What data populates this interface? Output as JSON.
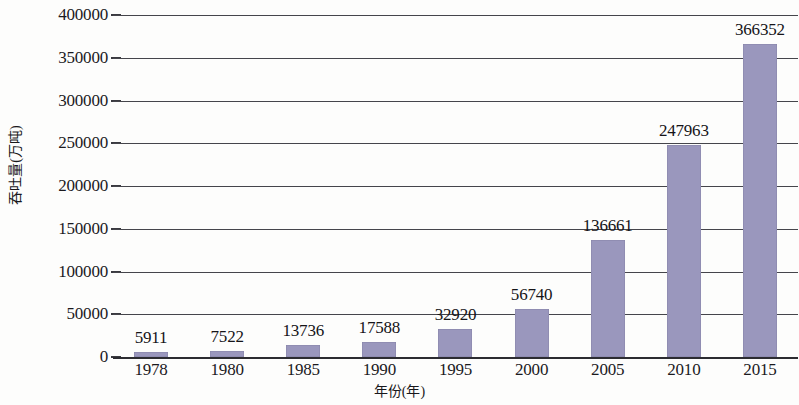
{
  "chart_data": {
    "type": "bar",
    "title": "",
    "subtitle": "",
    "xlabel": "年份(年)",
    "ylabel": "吞吐量(万吨)",
    "categories": [
      "1978",
      "1980",
      "1985",
      "1990",
      "1995",
      "2000",
      "2005",
      "2010",
      "2015"
    ],
    "values": [
      5911,
      7522,
      13736,
      17588,
      32920,
      56740,
      136661,
      247963,
      366352
    ],
    "data_labels": [
      "5911",
      "7522",
      "13736",
      "17588",
      "32920",
      "56740",
      "136661",
      "247963",
      "366352"
    ],
    "ylim": [
      0,
      400000
    ],
    "ytick_values": [
      0,
      50000,
      100000,
      150000,
      200000,
      250000,
      300000,
      350000,
      400000
    ],
    "ytick_labels": [
      "0",
      "50000",
      "100000",
      "150000",
      "200000",
      "250000",
      "300000",
      "350000",
      "400000"
    ],
    "grid": true,
    "grid_axis": "y",
    "legend": false,
    "legend_position": "none",
    "series": [
      {
        "name": "吞吐量",
        "values": [
          5911,
          7522,
          13736,
          17588,
          32920,
          56740,
          136661,
          247963,
          366352
        ]
      }
    ],
    "colors": {
      "bar_fill": "#9a97bd",
      "gridline": "#45454b",
      "axis_line": "#2c2c31",
      "text": "#1b1a1e",
      "background": "#fdfdfc"
    }
  }
}
